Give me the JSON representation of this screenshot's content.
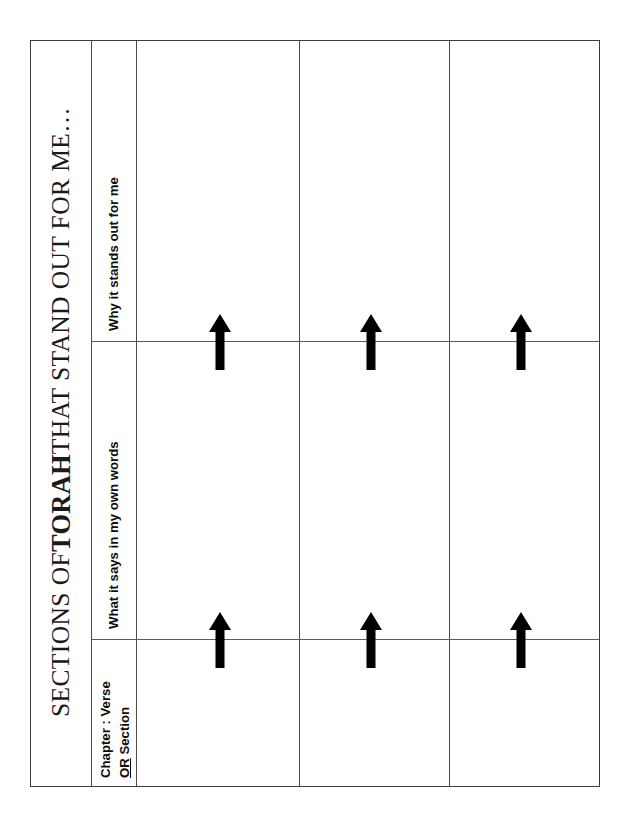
{
  "document": {
    "title_full": "SECTIONS OF TORAH THAT STAND OUT FOR ME…",
    "title_prefix": "SECTIONS OF ",
    "title_emphasis": "TORAH",
    "title_suffix": " THAT STAND OUT FOR ME…"
  },
  "table": {
    "column_headers": [
      {
        "id": "why-it-stands-out",
        "label": "Why it stands out for me"
      },
      {
        "id": "what-it-says",
        "label": "What it says in my own words"
      },
      {
        "id": "chapter-verse",
        "label_line1": "Chapter : Verse",
        "label_line2_underlined": "OR",
        "label_line2_rest": " Section"
      }
    ],
    "body_columns": 3,
    "body_rows": 3,
    "cells": [
      [
        "",
        "",
        ""
      ],
      [
        "",
        "",
        ""
      ],
      [
        "",
        "",
        ""
      ]
    ]
  },
  "arrows": {
    "glyph": "arrow-up-icon",
    "color": "#000000",
    "count": 6,
    "rows": [
      "upper-divider",
      "lower-divider"
    ],
    "columns": [
      "column-1",
      "column-2",
      "column-3"
    ]
  },
  "style": {
    "page_background": "#ffffff",
    "border_color": "#3c3c3c",
    "rule_color": "#4a4a4a",
    "text_color": "#111111"
  }
}
